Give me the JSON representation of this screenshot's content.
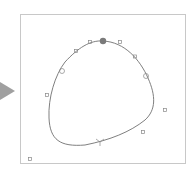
{
  "canvas": {
    "border_color": "#c8c8c8",
    "curve_color": "#707070",
    "handle_color": "#888888",
    "selected_point_color": "#7a7a7a",
    "corner_label": "a"
  },
  "play_arrow": {
    "icon": "triangle-right-icon",
    "color": "#a0a0a0"
  },
  "handles": [
    {
      "x": 90,
      "y": 42
    },
    {
      "x": 120,
      "y": 42
    },
    {
      "x": 76,
      "y": 51
    },
    {
      "x": 135,
      "y": 56
    },
    {
      "x": 62,
      "y": 71
    },
    {
      "x": 146,
      "y": 76
    },
    {
      "x": 47,
      "y": 95
    },
    {
      "x": 165,
      "y": 110
    },
    {
      "x": 143,
      "y": 132
    },
    {
      "x": 100,
      "y": 141
    },
    {
      "x": 30,
      "y": 160
    }
  ],
  "selected_point": {
    "x": 103,
    "y": 41
  }
}
